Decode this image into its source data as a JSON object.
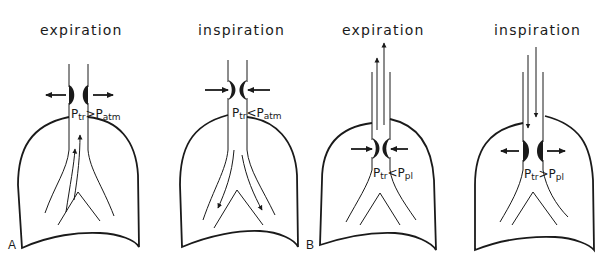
{
  "figure": {
    "panels": [
      {
        "id": "A1",
        "group_letter": "A",
        "title": "expiration",
        "pressure_label": {
          "p1": "P",
          "s1": "tr",
          "op": ">",
          "p2": "P",
          "s2": "atm"
        },
        "airway_state": "dilated",
        "airflow": "outward"
      },
      {
        "id": "A2",
        "group_letter": "",
        "title": "inspiration",
        "pressure_label": {
          "p1": "P",
          "s1": "tr",
          "op": "<",
          "p2": "P",
          "s2": "atm"
        },
        "airway_state": "compressed",
        "airflow": "inward"
      },
      {
        "id": "B1",
        "group_letter": "B",
        "title": "expiration",
        "pressure_label": {
          "p1": "P",
          "s1": "tr",
          "op": "<",
          "p2": "P",
          "s2": "pl"
        },
        "airway_state": "compressed",
        "airflow": "outward"
      },
      {
        "id": "B2",
        "group_letter": "",
        "title": "inspiration",
        "pressure_label": {
          "p1": "P",
          "s1": "tr",
          "op": ">",
          "p2": "P",
          "s2": "pl"
        },
        "airway_state": "dilated",
        "airflow": "inward"
      }
    ],
    "colors": {
      "ink": "#1a1a1a",
      "background": "#ffffff"
    }
  }
}
